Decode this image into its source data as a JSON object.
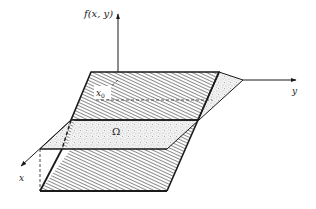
{
  "figure": {
    "labels": {
      "z_axis": "f(x, y)",
      "y_axis": "y",
      "x_axis": "x",
      "point": "x",
      "point_subscript": "0",
      "region": "Ω"
    },
    "colors": {
      "line": "#1a1a1a",
      "hatch": "#2a2a2a",
      "stipple": "#9a9a9a",
      "background": "#ffffff"
    }
  }
}
